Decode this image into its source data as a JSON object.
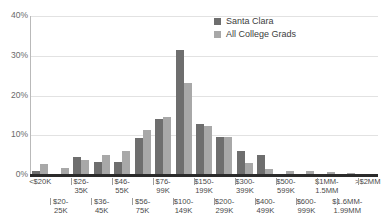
{
  "chart_data": {
    "type": "bar",
    "title": "",
    "subtitle": "",
    "xlabel": "",
    "ylabel": "",
    "ylim": [
      0,
      40
    ],
    "ytick_labels": [
      "0%",
      "10%",
      "20%",
      "30%",
      "40%"
    ],
    "ytick_values": [
      0,
      10,
      20,
      30,
      40
    ],
    "grid": true,
    "legend_position": "top-right",
    "categories": [
      "<$20K",
      "$20-25K",
      "$26-35K",
      "$36-45K",
      "$46-55K",
      "$56-75K",
      "$76-99K",
      "$100-149K",
      "$150-199K",
      "$200-299K",
      "$300-399K",
      "$400-499K",
      "$500-599K",
      "$600-999K",
      "$1MM-1.5MM",
      "$1.6MM-1.99MM",
      ">$2MM"
    ],
    "categories_display": [
      {
        "line1": "<$20K",
        "line2": ""
      },
      {
        "line1": "",
        "line2": "$20-25K"
      },
      {
        "line1": "$26-35K",
        "line2": ""
      },
      {
        "line1": "",
        "line2": "$36-45K"
      },
      {
        "line1": "$46-55K",
        "line2": ""
      },
      {
        "line1": "",
        "line2": "$56-75K"
      },
      {
        "line1": "$76-99K",
        "line2": ""
      },
      {
        "line1": "",
        "line2": "$100-149K"
      },
      {
        "line1": "$150-199K",
        "line2": ""
      },
      {
        "line1": "",
        "line2": "$200-299K"
      },
      {
        "line1": "$300-399K",
        "line2": ""
      },
      {
        "line1": "",
        "line2": "$400-499K"
      },
      {
        "line1": "$500-599K",
        "line2": ""
      },
      {
        "line1": "",
        "line2": "$600-999K"
      },
      {
        "line1": "$1MM-1.5MM",
        "line2": ""
      },
      {
        "line1": "",
        "line2": "$1.6MM-1.99MM"
      },
      {
        "line1": ">$2MM",
        "line2": ""
      }
    ],
    "series": [
      {
        "name": "Santa Clara",
        "color": "#6e6e6e",
        "values": [
          1.0,
          0.0,
          4.6,
          3.4,
          3.4,
          9.4,
          14.1,
          31.4,
          12.9,
          9.6,
          6.0,
          5.0,
          0.0,
          0.0,
          0.0,
          0.0,
          0.0
        ]
      },
      {
        "name": "All College Grads",
        "color": "#a8a8a8",
        "values": [
          2.8,
          1.8,
          3.7,
          5.0,
          6.0,
          11.2,
          14.6,
          23.1,
          12.3,
          9.6,
          3.0,
          1.5,
          1.1,
          1.0,
          0.7,
          0.4,
          0.3
        ]
      }
    ]
  },
  "legend": {
    "items": [
      {
        "label": "Santa Clara",
        "color": "#6e6e6e"
      },
      {
        "label": "All College Grads",
        "color": "#a8a8a8"
      }
    ]
  },
  "colors": {
    "santa_clara": "#6e6e6e",
    "all_college_grads": "#a8a8a8",
    "gridline": "#e2e2e2",
    "axis": "#2b2b2b",
    "tick_text": "#6a6a6a",
    "label_text": "#4a4a4a",
    "background": "#ffffff"
  }
}
